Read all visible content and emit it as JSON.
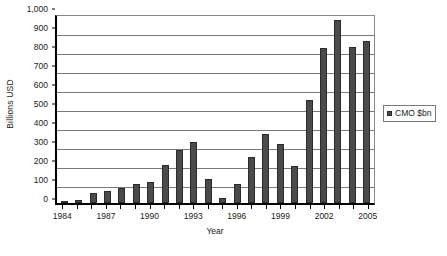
{
  "chart_data": {
    "type": "bar",
    "title": "",
    "xlabel": "Year",
    "ylabel": "Billions USD",
    "ylim": [
      0,
      1000
    ],
    "ytick_step": 100,
    "yticks": [
      0,
      100,
      200,
      300,
      400,
      500,
      600,
      700,
      800,
      900,
      1000
    ],
    "ytick_labels": [
      "0",
      "100",
      "200",
      "300",
      "400",
      "500",
      "600",
      "700",
      "800",
      "900",
      "1,000"
    ],
    "grid": true,
    "grid_axis": "y",
    "legend_position": "right",
    "series_name": "CMO $bn",
    "bar_color": "#4a4a4a",
    "bar_edge_color": "#2b2b2b",
    "categories": [
      "1984",
      "1985",
      "1986",
      "1987",
      "1988",
      "1989",
      "1990",
      "1991",
      "1992",
      "1993",
      "1994",
      "1995",
      "1996",
      "1997",
      "1998",
      "1999",
      "2000",
      "2001",
      "2002",
      "2003",
      "2004",
      "2005"
    ],
    "values": [
      12,
      18,
      52,
      65,
      78,
      98,
      112,
      200,
      280,
      322,
      125,
      28,
      100,
      240,
      362,
      310,
      193,
      542,
      817,
      965,
      820,
      855
    ],
    "xtick_labels": [
      "1984",
      "1987",
      "1990",
      "1993",
      "1996",
      "1999",
      "2002",
      "2005"
    ],
    "xtick_label_every": 3,
    "legend": [
      {
        "label": "CMO $bn",
        "color": "#4a4a4a"
      }
    ]
  }
}
